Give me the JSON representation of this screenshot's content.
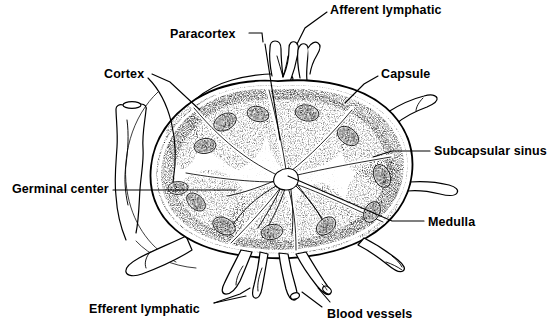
{
  "figure": {
    "style": "black-and-white line drawing with stipple shading",
    "background_color": "#ffffff",
    "ink_color": "#000000"
  },
  "labels": [
    {
      "id": "afferent-lymphatic",
      "text": "Afferent lymphatic",
      "x": 330,
      "y": 4
    },
    {
      "id": "paracortex",
      "text": "Paracortex",
      "x": 170,
      "y": 28
    },
    {
      "id": "capsule",
      "text": "Capsule",
      "x": 381,
      "y": 68
    },
    {
      "id": "cortex",
      "text": "Cortex",
      "x": 104,
      "y": 68
    },
    {
      "id": "subcapsular-sinus",
      "text": "Subcapsular sinus",
      "x": 434,
      "y": 145
    },
    {
      "id": "germinal-center",
      "text": "Germinal center",
      "x": 12,
      "y": 183
    },
    {
      "id": "medulla",
      "text": "Medulla",
      "x": 428,
      "y": 216
    },
    {
      "id": "efferent-lymphatic",
      "text": "Efferent lymphatic",
      "x": 89,
      "y": 303
    },
    {
      "id": "blood-vessels",
      "text": "Blood vessels",
      "x": 327,
      "y": 308
    }
  ],
  "structures": {
    "capsule": "thick dark outer rim enclosing the node",
    "subcapsular_sinus": "pale channel just inside the capsule",
    "cortex": "outer stippled zone containing follicles",
    "paracortex": "deep cortical zone between follicles and medulla",
    "medulla": "central pale cords converging on the hilum",
    "germinal_centers": "pale ovals with speckled rims inside cortical follicles",
    "afferent_lymphatics": "valved vessels entering the upper capsule",
    "efferent_lymphatics": "vessels leaving the lower hilum",
    "blood_vessels": "artery and vein at the hilum"
  },
  "counts": {
    "lobules": 8,
    "germinal_centers": 12,
    "afferent_vessels": 3,
    "hilar_vessels": 4
  }
}
